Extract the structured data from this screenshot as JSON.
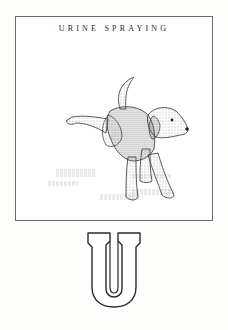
{
  "page": {
    "title": "URINE SPRAYING",
    "letter": "U",
    "illustration": {
      "subject": "dog-lifting-hind-leg",
      "style": "stippled-ink-drawing"
    },
    "colors": {
      "background": "#fdfdfc",
      "frame_border": "#6d6d6d",
      "ink": "#2b2b2b"
    }
  }
}
